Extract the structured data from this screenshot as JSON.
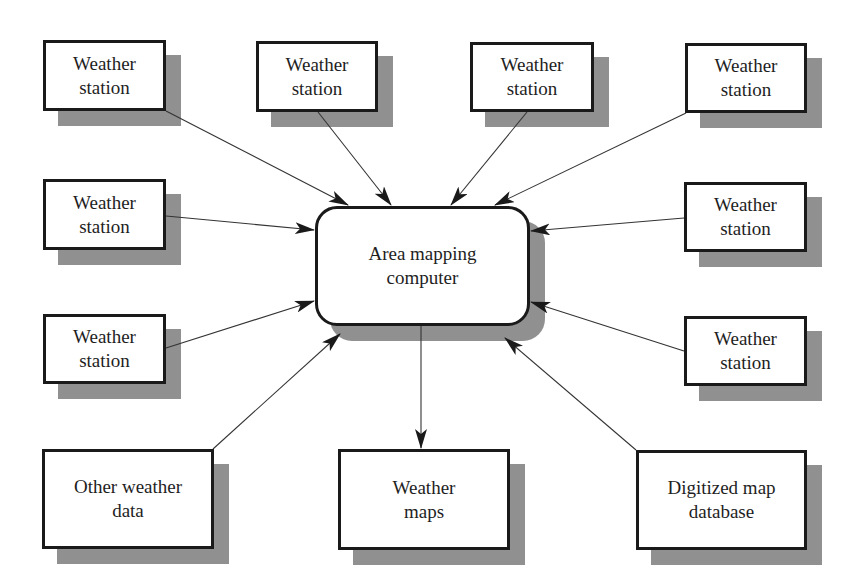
{
  "diagram": {
    "center": {
      "label_line1": "Area mapping",
      "label_line2": "computer"
    },
    "inputs": [
      {
        "id": "ws-top-1",
        "line1": "Weather",
        "line2": "station"
      },
      {
        "id": "ws-top-2",
        "line1": "Weather",
        "line2": "station"
      },
      {
        "id": "ws-top-3",
        "line1": "Weather",
        "line2": "station"
      },
      {
        "id": "ws-top-4",
        "line1": "Weather",
        "line2": "station"
      },
      {
        "id": "ws-left-1",
        "line1": "Weather",
        "line2": "station"
      },
      {
        "id": "ws-right-1",
        "line1": "Weather",
        "line2": "station"
      },
      {
        "id": "ws-left-2",
        "line1": "Weather",
        "line2": "station"
      },
      {
        "id": "ws-right-2",
        "line1": "Weather",
        "line2": "station"
      },
      {
        "id": "other-weather-data",
        "line1": "Other weather",
        "line2": "data"
      },
      {
        "id": "digitized-map-database",
        "line1": "Digitized map",
        "line2": "database"
      }
    ],
    "outputs": [
      {
        "id": "weather-maps",
        "line1": "Weather",
        "line2": "maps"
      }
    ],
    "colors": {
      "border": "#1a1a1a",
      "text": "#1e1e1e",
      "shadow": "#b8b8b8",
      "arrow": "#333333"
    }
  }
}
